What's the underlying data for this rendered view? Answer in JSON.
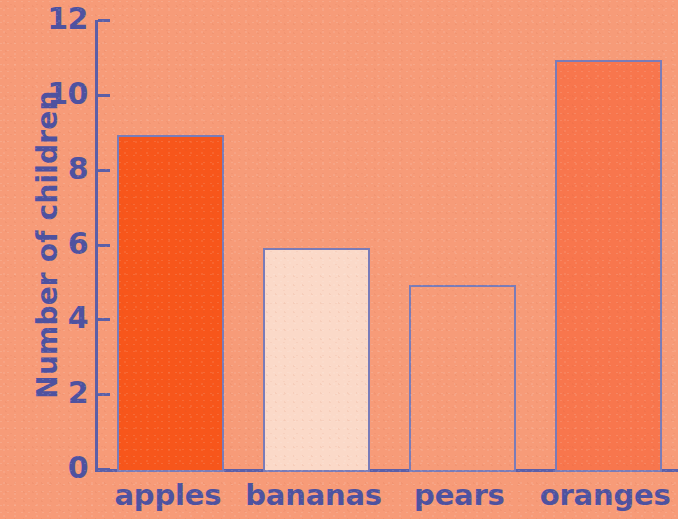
{
  "chart_data": {
    "type": "bar",
    "title": "",
    "subtitle": "",
    "xlabel": "",
    "ylabel": "Number of children",
    "categories": [
      "apples",
      "bananas",
      "pears",
      "oranges"
    ],
    "values": [
      9,
      6,
      5,
      11
    ],
    "ylim": [
      0,
      12
    ],
    "y_ticks": [
      0,
      2,
      4,
      6,
      8,
      10,
      12
    ],
    "y_tick_labels": [
      "0",
      "2",
      "4",
      "6",
      "8",
      "10",
      "12"
    ],
    "grid": false,
    "legend": null,
    "legend_position": "none",
    "bar_colors": [
      "#F7561B",
      "#FBD9C8",
      "#F79B78",
      "#F8764D"
    ],
    "bar_border_color": "#7A7CB8",
    "axis_color": "#5B5FA8",
    "text_color": "#4E52A0",
    "background_color": "#F79B78",
    "bars": [
      {
        "category": "apples",
        "value": 9,
        "fill": "#F7561B"
      },
      {
        "category": "bananas",
        "value": 6,
        "fill": "#FBD9C8"
      },
      {
        "category": "pears",
        "value": 5,
        "fill": "#F79B78"
      },
      {
        "category": "oranges",
        "value": 11,
        "fill": "#F8764D"
      }
    ]
  }
}
